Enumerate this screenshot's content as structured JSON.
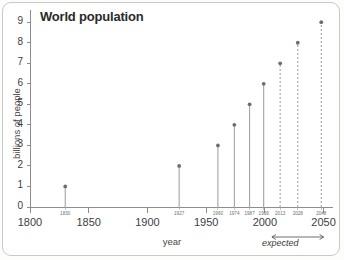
{
  "chart_data": {
    "type": "scatter",
    "title": "World population",
    "xlabel": "year",
    "ylabel": "billions of people",
    "xlim": [
      1800,
      2058
    ],
    "ylim": [
      0,
      9.4
    ],
    "grid": false,
    "legend": null,
    "x_major_ticks": [
      1800,
      1850,
      1900,
      1950,
      2000,
      2050
    ],
    "y_major_ticks": [
      0,
      1,
      2,
      3,
      4,
      5,
      6,
      7,
      8,
      9
    ],
    "annotation": "expected",
    "annotation_range": [
      2006,
      2050
    ],
    "series": [
      {
        "name": "observed",
        "style": "solid-stem",
        "x": [
          1830,
          1927,
          1960,
          1974,
          1987,
          1999
        ],
        "values": [
          1,
          2,
          3,
          4,
          5,
          6
        ]
      },
      {
        "name": "expected",
        "style": "dashed-stem",
        "x": [
          2013,
          2028,
          2048
        ],
        "values": [
          7,
          8,
          9
        ]
      }
    ],
    "points": [
      {
        "year": "1830",
        "value": 1,
        "projected": false
      },
      {
        "year": "1927",
        "value": 2,
        "projected": false
      },
      {
        "year": "1960",
        "value": 3,
        "projected": false
      },
      {
        "year": "1974",
        "value": 4,
        "projected": false
      },
      {
        "year": "1987",
        "value": 5,
        "projected": false
      },
      {
        "year": "1999",
        "value": 6,
        "projected": false
      },
      {
        "year": "2013",
        "value": 7,
        "projected": true
      },
      {
        "year": "2028",
        "value": 8,
        "projected": true
      },
      {
        "year": "2048",
        "value": 9,
        "projected": true
      }
    ],
    "colors": {
      "marker": "#6e6e6e",
      "stem": "#9a9a9a",
      "axis": "#8d8d8d",
      "title": "#2b2b2b",
      "frame": "#c9c9c7",
      "background": "#ffffff"
    }
  }
}
